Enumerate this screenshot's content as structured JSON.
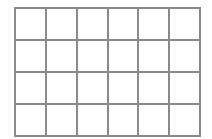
{
  "grid": {
    "rows": 4,
    "columns": 6,
    "line_color": "#8a8a8a",
    "background_color": "#ffffff",
    "cells": [
      [
        "",
        "",
        "",
        "",
        "",
        ""
      ],
      [
        "",
        "",
        "",
        "",
        "",
        ""
      ],
      [
        "",
        "",
        "",
        "",
        "",
        ""
      ],
      [
        "",
        "",
        "",
        "",
        "",
        ""
      ]
    ]
  }
}
